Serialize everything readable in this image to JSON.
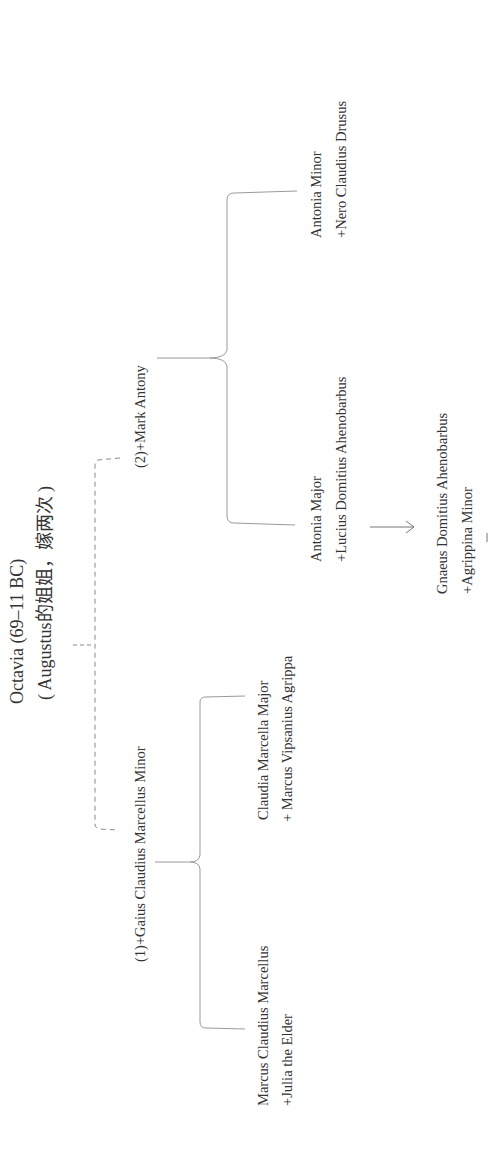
{
  "diagram": {
    "colors": {
      "line": "#9a9a9a",
      "text": "#333333",
      "background": "#ffffff"
    },
    "orientation": "rotated -90deg (reads bottom-to-top)",
    "root": {
      "name": "Octavia (69–11 BC)",
      "note": "( Augustus的姐姐，嫁两次 )"
    },
    "marriages": [
      {
        "label": "(1)+Gaius Claudius Marcellus Minor",
        "children": [
          {
            "name": "Claudia Marcella Major",
            "spouse": "+ Marcus Vipsanius Agrippa"
          },
          {
            "name": "Marcus Claudius Marcellus",
            "spouse": "+Julia the Elder"
          }
        ]
      },
      {
        "label": "(2)+Mark Antony",
        "children": [
          {
            "name": "Antonia Minor",
            "spouse": "+Nero Claudius Drusus"
          },
          {
            "name": "Antonia Major",
            "spouse": "+Lucius Domitius Ahenobarbus"
          }
        ]
      }
    ],
    "descendant": {
      "name": "Gnaeus Domitius Ahenobarbus",
      "spouse": "+Agrippina Minor",
      "connector": "arrow-right"
    }
  }
}
